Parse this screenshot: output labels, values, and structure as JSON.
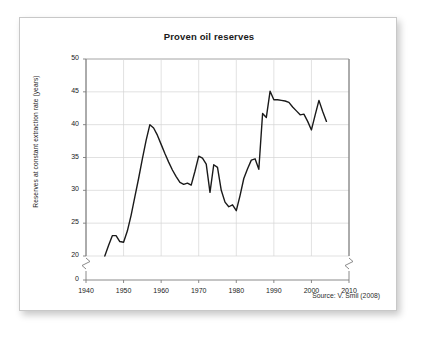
{
  "figure": {
    "title": "Proven oil reserves",
    "source": "Source: V. Smil (2008)"
  },
  "chart_data": {
    "type": "line",
    "title": "Proven oil reserves",
    "xlabel": "",
    "ylabel": "Reserves at constant extraction rate (years)",
    "source": "Source: V. Smil (2008)",
    "grid": true,
    "legend": null,
    "legend_position": "none",
    "xlim": [
      1940,
      2010
    ],
    "ylim": [
      0,
      50
    ],
    "y_axis_break": true,
    "y_axis_break_between": [
      0,
      20
    ],
    "x_axis_break_left": true,
    "x_axis_break_right": true,
    "xticks": [
      1940,
      1950,
      1960,
      1970,
      1980,
      1990,
      2000,
      2010
    ],
    "xtick_labels": [
      "1940",
      "1950",
      "1960",
      "1970",
      "1980",
      "1990",
      "2000",
      "2010"
    ],
    "yticks": [
      0,
      20,
      25,
      30,
      35,
      40,
      45,
      50
    ],
    "ytick_labels": [
      "0",
      "20",
      "25",
      "30",
      "35",
      "40",
      "45",
      "50"
    ],
    "line_color": "#1a1a1a",
    "line_width": 1.4,
    "series": [
      {
        "name": "Proven oil reserves",
        "x": [
          1945,
          1946,
          1947,
          1948,
          1949,
          1950,
          1951,
          1952,
          1953,
          1954,
          1955,
          1956,
          1957,
          1958,
          1959,
          1960,
          1961,
          1962,
          1963,
          1964,
          1965,
          1966,
          1967,
          1968,
          1969,
          1970,
          1971,
          1972,
          1973,
          1974,
          1975,
          1976,
          1977,
          1978,
          1979,
          1980,
          1981,
          1982,
          1983,
          1984,
          1985,
          1986,
          1987,
          1988,
          1989,
          1990,
          1991,
          1992,
          1993,
          1994,
          1995,
          1996,
          1997,
          1998,
          1999,
          2000,
          2001,
          2002,
          2003,
          2004
        ],
        "values": [
          20.0,
          21.6,
          23.1,
          23.1,
          22.2,
          22.1,
          23.8,
          26.2,
          29.0,
          31.8,
          34.8,
          37.6,
          40.0,
          39.5,
          38.4,
          37.0,
          35.6,
          34.3,
          33.1,
          32.1,
          31.2,
          30.9,
          31.1,
          30.8,
          32.9,
          35.2,
          34.9,
          34.0,
          29.7,
          33.9,
          33.5,
          30.0,
          28.2,
          27.5,
          27.8,
          26.9,
          29.2,
          31.8,
          33.3,
          34.6,
          34.8,
          33.2,
          41.7,
          41.1,
          45.1,
          43.8,
          43.8,
          43.7,
          43.6,
          43.4,
          42.7,
          42.1,
          41.5,
          41.6,
          40.5,
          39.2,
          41.5,
          43.7,
          42.0,
          40.5
        ]
      }
    ]
  }
}
